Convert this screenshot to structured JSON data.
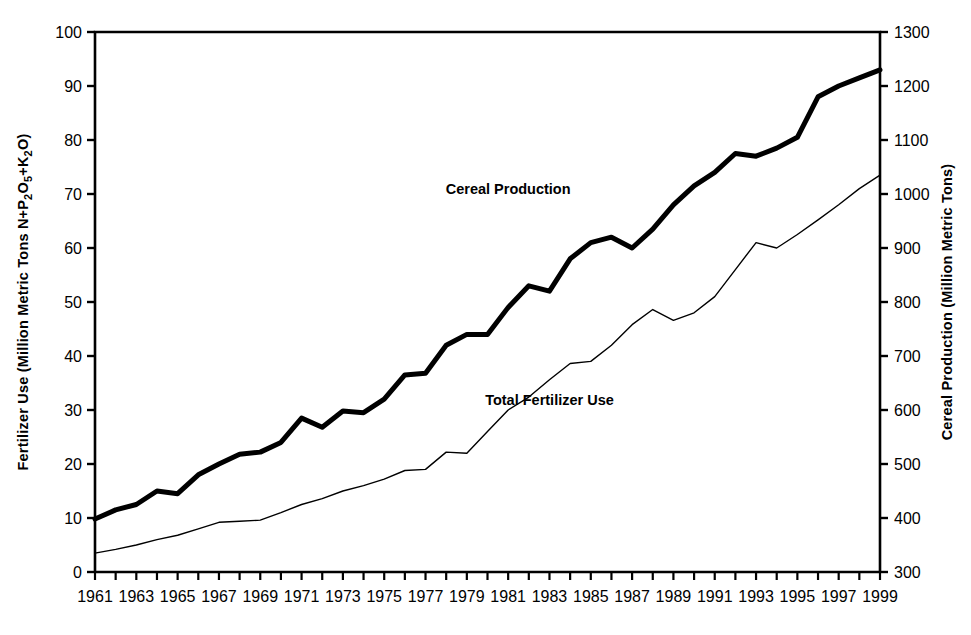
{
  "chart_data": {
    "type": "line",
    "title": "",
    "subtitle": "",
    "xlabel": "",
    "grid": false,
    "legend_position": "inline-annotations",
    "x": [
      1961,
      1962,
      1963,
      1964,
      1965,
      1966,
      1967,
      1968,
      1969,
      1970,
      1971,
      1972,
      1973,
      1974,
      1975,
      1976,
      1977,
      1978,
      1979,
      1980,
      1981,
      1982,
      1983,
      1984,
      1985,
      1986,
      1987,
      1988,
      1989,
      1990,
      1991,
      1992,
      1993,
      1994,
      1995,
      1996,
      1997,
      1998,
      1999
    ],
    "xtick_labels": [
      "1961",
      "1963",
      "1965",
      "1967",
      "1969",
      "1971",
      "1973",
      "1975",
      "1977",
      "1979",
      "1981",
      "1983",
      "1985",
      "1987",
      "1989",
      "1991",
      "1993",
      "1995",
      "1997",
      "1999"
    ],
    "left_axis": {
      "label": "Fertilizer Use (Million Metric Tons N+P",
      "label_sub1": "2",
      "label_mid": "O",
      "label_sub2": "5",
      "label_end": "+K",
      "label_sub3": "2",
      "label_tail": "O)",
      "label_plain": "Fertilizer Use (Million Metric Tons N+P2O5+K2O)",
      "min": 0,
      "max": 100,
      "ticks": [
        0,
        10,
        20,
        30,
        40,
        50,
        60,
        70,
        80,
        90,
        100
      ],
      "tick_labels": [
        "0",
        "10",
        "20",
        "30",
        "40",
        "50",
        "60",
        "70",
        "80",
        "90",
        "100"
      ]
    },
    "right_axis": {
      "label": "Cereal Production (Million Metric Tons)",
      "min": 300,
      "max": 1300,
      "ticks": [
        300,
        400,
        500,
        600,
        700,
        800,
        900,
        1000,
        1100,
        1200,
        1300
      ],
      "tick_labels": [
        "300",
        "400",
        "500",
        "600",
        "700",
        "800",
        "900",
        "1000",
        "1100",
        "1200",
        "1300"
      ]
    },
    "series": [
      {
        "name": "Cereal Production",
        "axis": "right",
        "units": "Million Metric Tons",
        "style": "thick-black",
        "line_width": 5,
        "color": "#000000",
        "annotation": "Cereal Production",
        "values": [
          398,
          415,
          425,
          450,
          445,
          480,
          500,
          518,
          522,
          540,
          585,
          568,
          598,
          595,
          620,
          665,
          668,
          720,
          740,
          740,
          790,
          830,
          820,
          880,
          910,
          920,
          900,
          935,
          980,
          1015,
          1040,
          1075,
          1070,
          1085,
          1105,
          1180,
          1200,
          1215,
          1230
        ]
      },
      {
        "name": "Total Fertilizer Use",
        "axis": "left",
        "units": "Million Metric Tons N+P2O5+K2O",
        "style": "thin-black",
        "line_width": 1.4,
        "color": "#000000",
        "annotation": "Total Fertilizer Use",
        "values": [
          3.5,
          4.2,
          5.0,
          6.0,
          6.8,
          8.0,
          9.2,
          9.4,
          9.6,
          11.0,
          12.5,
          13.6,
          15.0,
          16.0,
          17.2,
          18.8,
          19.0,
          22.2,
          22.0,
          26.0,
          30.0,
          32.4,
          35.6,
          38.6,
          39.0,
          42.0,
          45.8,
          48.6,
          46.6,
          48.0,
          51.0,
          56.0,
          61.0,
          60.0,
          62.5,
          65.2,
          68.0,
          71.0,
          73.5
        ]
      }
    ],
    "annotations": [
      {
        "text": "Cereal Production",
        "x": 1981.0,
        "y_axis": "right",
        "y": 1000
      },
      {
        "text": "Total Fertilizer Use",
        "x": 1983.0,
        "y_axis": "left",
        "y": 31
      }
    ]
  }
}
